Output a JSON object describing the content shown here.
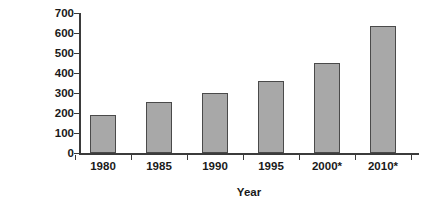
{
  "chart_data": {
    "type": "bar",
    "title": "",
    "categories": [
      "1980",
      "1985",
      "1990",
      "1995",
      "2000*",
      "2010*"
    ],
    "values": [
      190,
      255,
      300,
      360,
      450,
      635
    ],
    "xlabel": "Year",
    "ylabel": "Population (millions)",
    "ylim": [
      0,
      700
    ],
    "ytick_step": 100,
    "yticks": [
      "700",
      "600",
      "500",
      "400",
      "300",
      "200",
      "100",
      "0"
    ],
    "ytick_values": [
      700,
      600,
      500,
      400,
      300,
      200,
      100,
      0
    ],
    "grid": false,
    "legend": false,
    "bar_fill_color": "#a8a8a8",
    "bar_border_color": "#4a4a4a",
    "axis_color": "#3b3b3b",
    "text_color": "#1a1a1a",
    "background_color": "#ffffff"
  }
}
